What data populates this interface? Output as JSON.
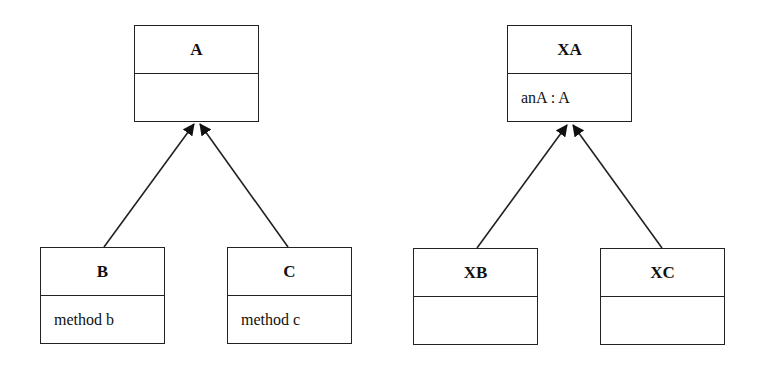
{
  "diagram": {
    "type": "uml-class-diagram",
    "left_hierarchy": {
      "parent": {
        "name": "A",
        "body": ""
      },
      "children": [
        {
          "name": "B",
          "body": "method b"
        },
        {
          "name": "C",
          "body": "method c"
        }
      ]
    },
    "right_hierarchy": {
      "parent": {
        "name": "XA",
        "body": "anA : A"
      },
      "children": [
        {
          "name": "XB",
          "body": ""
        },
        {
          "name": "XC",
          "body": ""
        }
      ]
    },
    "relations": [
      {
        "from": "B",
        "to": "A",
        "type": "generalization"
      },
      {
        "from": "C",
        "to": "A",
        "type": "generalization"
      },
      {
        "from": "XB",
        "to": "XA",
        "type": "generalization"
      },
      {
        "from": "XC",
        "to": "XA",
        "type": "generalization"
      }
    ]
  }
}
